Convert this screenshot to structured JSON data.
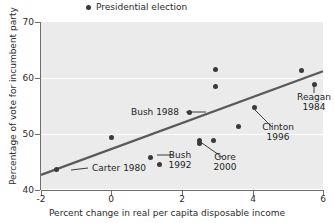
{
  "legend": {
    "items": [
      {
        "label": "Presidential election",
        "marker": "dot",
        "color": "#3a3a3a"
      }
    ]
  },
  "axes": {
    "x_title": "Percent change in real per capita disposable income",
    "y_title": "Percentage of vote for incumbent party",
    "x_ticks": [
      "-2",
      "0",
      "2",
      "4",
      "6"
    ],
    "y_ticks": [
      "70",
      "60",
      "50",
      "40"
    ]
  },
  "annotations": [
    {
      "id": "bush-1988",
      "line1": "Bush 1988",
      "line2": ""
    },
    {
      "id": "carter-1980",
      "line1": "Carter 1980",
      "line2": ""
    },
    {
      "id": "bush-1992",
      "line1": "Bush",
      "line2": "1992"
    },
    {
      "id": "gore-2000",
      "line1": "Gore",
      "line2": "2000"
    },
    {
      "id": "clinton-1996",
      "line1": "Clinton",
      "line2": "1996"
    },
    {
      "id": "reagan-1984",
      "line1": "Reagan",
      "line2": "1984"
    }
  ],
  "chart_data": {
    "type": "scatter",
    "title": "",
    "xlabel": "Percent change in real per capita disposable income",
    "ylabel": "Percentage of vote for incumbent party",
    "xlim": [
      -2,
      6
    ],
    "ylim": [
      40,
      70
    ],
    "xticks": [
      -2,
      0,
      2,
      4,
      6
    ],
    "yticks": [
      40,
      50,
      60,
      70
    ],
    "grid": "horizontal-white",
    "legend_position": "above-plot-left",
    "plot_background": "#ebebeb",
    "marker_color": "#3a3a3a",
    "trendline_color": "#595959",
    "series": [
      {
        "name": "Presidential election",
        "points": [
          {
            "x": -1.55,
            "y": 43.6,
            "label": "Carter 1980"
          },
          {
            "x": 0.0,
            "y": 49.4,
            "label": ""
          },
          {
            "x": 1.1,
            "y": 45.8,
            "label": "Bush 1992"
          },
          {
            "x": 1.35,
            "y": 44.6,
            "label": ""
          },
          {
            "x": 2.2,
            "y": 53.8,
            "label": "Bush 1988"
          },
          {
            "x": 2.5,
            "y": 48.9,
            "label": "Gore 2000"
          },
          {
            "x": 2.5,
            "y": 48.3,
            "label": ""
          },
          {
            "x": 2.9,
            "y": 48.8,
            "label": ""
          },
          {
            "x": 2.95,
            "y": 61.6,
            "label": ""
          },
          {
            "x": 2.95,
            "y": 58.5,
            "label": ""
          },
          {
            "x": 3.6,
            "y": 51.3,
            "label": ""
          },
          {
            "x": 4.05,
            "y": 54.7,
            "label": "Clinton 1996"
          },
          {
            "x": 5.4,
            "y": 61.4,
            "label": ""
          },
          {
            "x": 5.75,
            "y": 58.9,
            "label": "Reagan 1984"
          }
        ]
      }
    ],
    "trendline": {
      "x0": -2,
      "y0": 42.7,
      "x1": 6,
      "y1": 61.2
    }
  }
}
